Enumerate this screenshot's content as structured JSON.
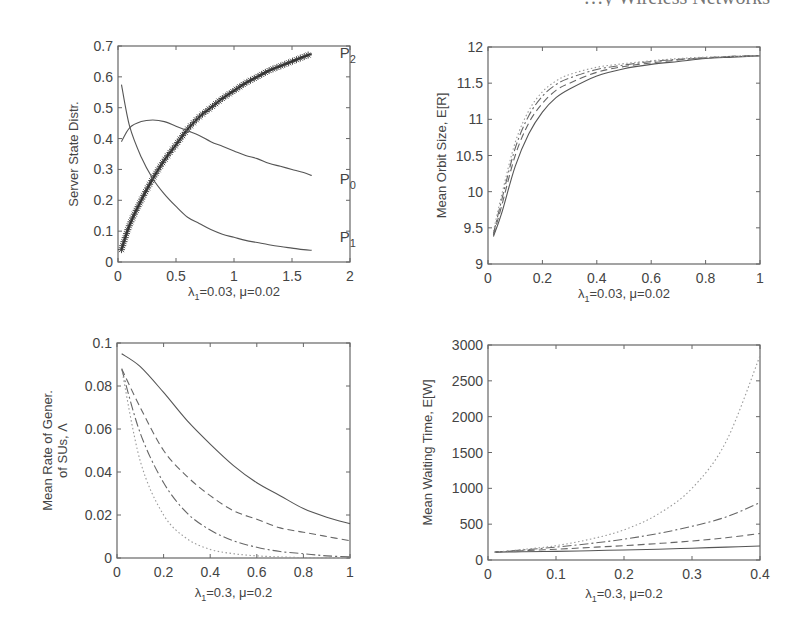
{
  "page": {
    "header_clipped_text": "…y Wireless Networks"
  },
  "chart_data": [
    {
      "type": "line",
      "panel": "top-left",
      "title": "",
      "xlabel": "λ1=0.03, μ=0.02",
      "xlabel_parts": {
        "lambda_sub": "1",
        "lambda_val": "=0.03, ",
        "mu": "μ",
        "mu_val": "=0.02"
      },
      "ylabel": "Server State Distr.",
      "xlim": [
        0,
        2
      ],
      "ylim": [
        0,
        0.7
      ],
      "xticks": [
        "0",
        "0.5",
        "1",
        "1.5",
        "2"
      ],
      "yticks": [
        "0",
        "0.1",
        "0.2",
        "0.3",
        "0.4",
        "0.5",
        "0.6",
        "0.7"
      ],
      "grid": false,
      "x": [
        0.03,
        0.1,
        0.2,
        0.3,
        0.4,
        0.5,
        0.6,
        0.7,
        0.8,
        0.9,
        1.0,
        1.1,
        1.2,
        1.3,
        1.4,
        1.5,
        1.6,
        1.67
      ],
      "series": [
        {
          "name": "P2",
          "label": "P",
          "sub": "2",
          "style": "solid-asterisk",
          "values": [
            0.04,
            0.12,
            0.2,
            0.27,
            0.33,
            0.38,
            0.43,
            0.47,
            0.5,
            0.53,
            0.555,
            0.58,
            0.6,
            0.62,
            0.635,
            0.65,
            0.665,
            0.675
          ]
        },
        {
          "name": "P0",
          "label": "P",
          "sub": "0",
          "style": "solid",
          "values": [
            0.39,
            0.435,
            0.455,
            0.46,
            0.455,
            0.44,
            0.425,
            0.41,
            0.39,
            0.375,
            0.36,
            0.345,
            0.335,
            0.32,
            0.31,
            0.3,
            0.29,
            0.28
          ]
        },
        {
          "name": "P1",
          "label": "P",
          "sub": "1",
          "style": "solid",
          "values": [
            0.575,
            0.44,
            0.34,
            0.27,
            0.22,
            0.18,
            0.145,
            0.125,
            0.105,
            0.09,
            0.08,
            0.07,
            0.063,
            0.056,
            0.05,
            0.045,
            0.04,
            0.038
          ]
        }
      ]
    },
    {
      "type": "line",
      "panel": "top-right",
      "title": "",
      "xlabel": "λ1=0.03, μ=0.02",
      "xlabel_parts": {
        "lambda_sub": "1",
        "lambda_val": "=0.03, ",
        "mu": "μ",
        "mu_val": "=0.02"
      },
      "ylabel": "Mean Orbit Size, E[R]",
      "xlim": [
        0,
        1
      ],
      "ylim": [
        9,
        12
      ],
      "xticks": [
        "0",
        "0.2",
        "0.4",
        "0.6",
        "0.8",
        "1"
      ],
      "yticks": [
        "9",
        "9.5",
        "10",
        "10.5",
        "11",
        "11.5",
        "12"
      ],
      "grid": false,
      "x": [
        0.02,
        0.05,
        0.1,
        0.15,
        0.2,
        0.25,
        0.3,
        0.4,
        0.5,
        0.6,
        0.7,
        0.8,
        0.9,
        1.0
      ],
      "series": [
        {
          "name": "solid",
          "style": "solid",
          "values": [
            9.38,
            9.7,
            10.35,
            10.8,
            11.1,
            11.3,
            11.42,
            11.6,
            11.7,
            11.76,
            11.8,
            11.84,
            11.86,
            11.88
          ]
        },
        {
          "name": "dashed",
          "style": "dashed",
          "values": [
            9.4,
            9.8,
            10.5,
            10.95,
            11.22,
            11.4,
            11.5,
            11.65,
            11.73,
            11.78,
            11.82,
            11.85,
            11.87,
            11.88
          ]
        },
        {
          "name": "dash-dot",
          "style": "dashdot",
          "values": [
            9.42,
            9.88,
            10.6,
            11.05,
            11.32,
            11.48,
            11.57,
            11.69,
            11.75,
            11.8,
            11.83,
            11.85,
            11.87,
            11.88
          ]
        },
        {
          "name": "dotted",
          "style": "dotted",
          "values": [
            9.45,
            9.95,
            10.68,
            11.12,
            11.38,
            11.53,
            11.62,
            11.72,
            11.77,
            11.81,
            11.84,
            11.86,
            11.87,
            11.88
          ]
        }
      ]
    },
    {
      "type": "line",
      "panel": "bottom-left",
      "title": "",
      "xlabel": "λ1=0.3, μ=0.2",
      "xlabel_parts": {
        "lambda_sub": "1",
        "lambda_val": "=0.3, ",
        "mu": "μ",
        "mu_val": "=0.2"
      },
      "ylabel": "Mean Rate of Gener. of SUs, Λ",
      "ylabel_lines": [
        "Mean Rate of Gener.",
        "of SUs, Λ"
      ],
      "xlim": [
        0,
        1
      ],
      "ylim": [
        0,
        0.1
      ],
      "xticks": [
        "0",
        "0.2",
        "0.4",
        "0.6",
        "0.8",
        "1"
      ],
      "yticks": [
        "0",
        "0.02",
        "0.04",
        "0.06",
        "0.08",
        "0.1"
      ],
      "grid": false,
      "x": [
        0.02,
        0.1,
        0.2,
        0.3,
        0.4,
        0.5,
        0.6,
        0.7,
        0.8,
        0.9,
        1.0
      ],
      "series": [
        {
          "name": "solid",
          "style": "solid",
          "values": [
            0.095,
            0.089,
            0.077,
            0.064,
            0.053,
            0.043,
            0.035,
            0.029,
            0.023,
            0.019,
            0.016
          ]
        },
        {
          "name": "dashed",
          "style": "dashed",
          "values": [
            0.088,
            0.07,
            0.05,
            0.038,
            0.029,
            0.022,
            0.018,
            0.014,
            0.012,
            0.01,
            0.008
          ]
        },
        {
          "name": "dash-dot",
          "style": "dashdot",
          "values": [
            0.088,
            0.058,
            0.035,
            0.021,
            0.013,
            0.008,
            0.005,
            0.003,
            0.002,
            0.001,
            0.0005
          ]
        },
        {
          "name": "dotted",
          "style": "dotted",
          "values": [
            0.088,
            0.045,
            0.02,
            0.009,
            0.004,
            0.002,
            0.001,
            0.0005,
            0.0002,
            0.0001,
            0.0
          ]
        }
      ]
    },
    {
      "type": "line",
      "panel": "bottom-right",
      "title": "",
      "xlabel": "λ1=0.3, μ=0.2",
      "xlabel_parts": {
        "lambda_sub": "1",
        "lambda_val": "=0.3, ",
        "mu": "μ",
        "mu_val": "=0.2"
      },
      "ylabel": "Mean Waiting Time, E[W]",
      "xlim": [
        0,
        0.4
      ],
      "ylim": [
        0,
        3000
      ],
      "xticks": [
        "0",
        "0.1",
        "0.2",
        "0.3",
        "0.4"
      ],
      "yticks": [
        "0",
        "500",
        "1000",
        "1500",
        "2000",
        "2500",
        "3000"
      ],
      "grid": false,
      "x": [
        0.01,
        0.05,
        0.1,
        0.15,
        0.2,
        0.25,
        0.3,
        0.35,
        0.4
      ],
      "series": [
        {
          "name": "solid",
          "style": "solid",
          "values": [
            110,
            115,
            120,
            130,
            140,
            150,
            165,
            180,
            195
          ]
        },
        {
          "name": "dashed",
          "style": "dashed",
          "values": [
            110,
            130,
            150,
            175,
            200,
            230,
            265,
            310,
            370
          ]
        },
        {
          "name": "dash-dot",
          "style": "dashdot",
          "values": [
            110,
            140,
            180,
            230,
            290,
            370,
            470,
            600,
            800
          ]
        },
        {
          "name": "dotted",
          "style": "dotted",
          "values": [
            110,
            145,
            200,
            290,
            420,
            640,
            1000,
            1650,
            2850
          ]
        }
      ]
    }
  ]
}
